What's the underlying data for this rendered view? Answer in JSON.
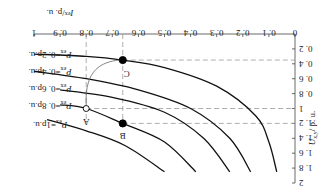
{
  "chart_data": {
    "type": "line",
    "orientation_note": "figure displayed rotated 180 degrees",
    "title": "",
    "xlabel": "I_ex / p.u.",
    "ylabel": "U_x,y / p.u.",
    "xlim": [
      0,
      1
    ],
    "ylim": [
      0,
      2
    ],
    "x_ticks": [
      "0",
      "0.1",
      "0.2",
      "0.3",
      "0.4",
      "0.5",
      "0.6",
      "0.7",
      "0.8",
      "0.9",
      "1"
    ],
    "y_ticks": [
      "0.2",
      "0.4",
      "0.6",
      "0.8",
      "1",
      "1.2",
      "1.4",
      "1.6",
      "1.8",
      "2"
    ],
    "grid": false,
    "series": [
      {
        "name": "P_ex=0.2p.u.",
        "label": "P",
        "sub": "ex",
        "value": "=0.2p.u.",
        "points": [
          [
            1.0,
            0.27
          ],
          [
            0.8,
            0.3
          ],
          [
            0.66,
            0.35
          ],
          [
            0.5,
            0.45
          ],
          [
            0.3,
            0.7
          ],
          [
            0.15,
            1.1
          ],
          [
            0.1,
            1.45
          ],
          [
            0.07,
            1.85
          ]
        ]
      },
      {
        "name": "P_ex=0.4p.u.",
        "label": "P",
        "sub": "ex",
        "value": "=0.4p.u.",
        "points": [
          [
            1.0,
            0.5
          ],
          [
            0.8,
            0.6
          ],
          [
            0.6,
            0.75
          ],
          [
            0.4,
            1.0
          ],
          [
            0.25,
            1.4
          ],
          [
            0.17,
            1.85
          ]
        ]
      },
      {
        "name": "P_ex=0.6p.u.",
        "label": "P",
        "sub": "ex",
        "value": "=0.6p.u.",
        "points": [
          [
            0.9,
            0.75
          ],
          [
            0.7,
            0.85
          ],
          [
            0.5,
            1.05
          ],
          [
            0.35,
            1.4
          ],
          [
            0.25,
            1.85
          ]
        ]
      },
      {
        "name": "P_ex=0.8p.u.",
        "label": "P",
        "sub": "ex",
        "value": "=0.8p.u.",
        "points": [
          [
            0.9,
            0.95
          ],
          [
            0.8,
            1.0
          ],
          [
            0.66,
            1.2
          ],
          [
            0.5,
            1.45
          ],
          [
            0.38,
            1.85
          ]
        ]
      },
      {
        "name": "P_ex=1p.u.",
        "label": "P",
        "sub": "ex",
        "value": "=1p.u.",
        "points": [
          [
            0.95,
            1.15
          ],
          [
            0.8,
            1.3
          ],
          [
            0.65,
            1.5
          ],
          [
            0.5,
            1.85
          ]
        ]
      }
    ],
    "annotations": [
      {
        "label": "A",
        "x": 0.8,
        "y": 1.0,
        "marker": "open-circle"
      },
      {
        "label": "B",
        "x": 0.66,
        "y": 1.2,
        "marker": "filled-circle"
      },
      {
        "label": "C",
        "x": 0.66,
        "y": 0.35,
        "marker": "filled-circle"
      }
    ],
    "guides": {
      "vertical_dashed_x": [
        0.8,
        0.66
      ],
      "horizontal_dashed_y": [
        0.35,
        1.0,
        1.2
      ]
    },
    "legend_position": "curve labels at left (in rotated view)"
  }
}
